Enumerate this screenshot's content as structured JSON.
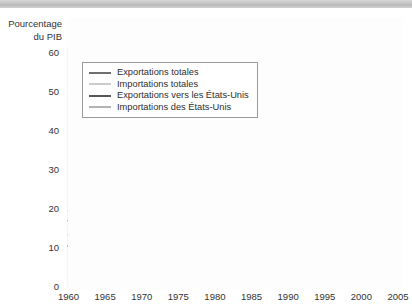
{
  "figure": {
    "axis_title_line1": "Pourcentage",
    "axis_title_line2": "du PIB"
  },
  "colors": {
    "exports_total": "#6f6f6f",
    "imports_total": "#cbcbcb",
    "exports_us": "#555555",
    "imports_us": "#b2b2b2",
    "axis": "#4a4a4a",
    "top_bar": "#c3c3c3"
  },
  "legend": {
    "items": [
      {
        "label": "Exportations totales",
        "series": "exports_total"
      },
      {
        "label": "Importations totales",
        "series": "imports_total"
      },
      {
        "label": "Exportations vers les États-Unis",
        "series": "exports_us"
      },
      {
        "label": "Importations des États-Unis",
        "series": "imports_us"
      }
    ]
  },
  "chart_data": {
    "type": "line",
    "title": "",
    "xlabel": "",
    "ylabel": "Pourcentage du PIB",
    "xlim": [
      1960,
      2005
    ],
    "ylim": [
      0,
      60
    ],
    "ytick_labels": [
      "0",
      "10",
      "20",
      "30",
      "40",
      "50",
      "60"
    ],
    "yticks": [
      0,
      10,
      20,
      30,
      40,
      50,
      60
    ],
    "xtick_labels": [
      "1960",
      "1965",
      "1970",
      "1975",
      "1980",
      "1985",
      "1990",
      "1995",
      "2000",
      "2005"
    ],
    "xticks": [
      1960,
      1965,
      1970,
      1975,
      1980,
      1985,
      1990,
      1995,
      2000,
      2005
    ],
    "minor_xticks_every": 1,
    "grid": false,
    "legend_position": "upper-left-inside",
    "x": [
      1960,
      1961,
      1962,
      1963,
      1964,
      1965,
      1966,
      1967,
      1968,
      1969,
      1970,
      1971,
      1972,
      1973,
      1974,
      1975,
      1976,
      1977,
      1978,
      1979,
      1980,
      1981,
      1982,
      1983,
      1984,
      1985,
      1986,
      1987,
      1988,
      1989,
      1990,
      1991,
      1992,
      1993,
      1994,
      1995,
      1996,
      1997,
      1998,
      1999,
      2000,
      2001,
      2002,
      2003,
      2004,
      2005
    ],
    "series": [
      {
        "name": "Exportations totales",
        "key": "exports_total",
        "color": "#6f6f6f",
        "values": [
          17.0,
          17.5,
          17.8,
          18.3,
          19.5,
          19.3,
          20.3,
          20.8,
          21.9,
          22.0,
          22.6,
          22.0,
          22.3,
          23.5,
          25.5,
          24.2,
          23.6,
          25.2,
          26.6,
          28.3,
          28.7,
          27.3,
          26.1,
          25.5,
          28.3,
          28.0,
          27.5,
          26.6,
          26.5,
          25.8,
          25.9,
          25.0,
          27.0,
          29.8,
          33.6,
          37.1,
          38.2,
          40.0,
          42.5,
          44.0,
          45.6,
          43.7,
          41.4,
          38.3,
          38.7,
          37.5
        ]
      },
      {
        "name": "Importations totales",
        "key": "imports_total",
        "color": "#cbcbcb",
        "values": [
          19.5,
          19.2,
          19.4,
          19.5,
          20.3,
          21.3,
          23.0,
          23.1,
          24.2,
          24.6,
          23.3,
          23.5,
          24.3,
          25.4,
          28.4,
          26.1,
          25.5,
          26.8,
          28.1,
          29.9,
          29.3,
          28.4,
          26.1,
          26.0,
          28.9,
          29.5,
          29.5,
          28.3,
          28.6,
          27.8,
          27.1,
          27.0,
          28.6,
          31.0,
          34.1,
          36.0,
          36.1,
          39.3,
          41.2,
          42.2,
          43.2,
          40.6,
          39.2,
          37.0,
          38.0,
          38.6
        ]
      },
      {
        "name": "Exportations vers les États-Unis",
        "key": "exports_us",
        "color": "#555555",
        "values": [
          10.5,
          10.9,
          11.1,
          11.5,
          12.1,
          12.4,
          13.4,
          13.8,
          15.0,
          15.5,
          15.6,
          15.4,
          15.9,
          16.6,
          17.2,
          15.5,
          16.6,
          17.9,
          19.3,
          19.5,
          18.6,
          18.8,
          18.2,
          19.4,
          22.2,
          22.3,
          21.8,
          21.4,
          21.3,
          20.5,
          20.6,
          20.1,
          22.0,
          24.6,
          28.1,
          29.7,
          30.2,
          31.5,
          33.9,
          35.9,
          38.6,
          36.4,
          34.3,
          31.5,
          31.8,
          31.3
        ]
      },
      {
        "name": "Importations des États-Unis",
        "key": "imports_us",
        "color": "#b2b2b2",
        "values": [
          13.4,
          12.9,
          13.1,
          13.0,
          13.5,
          14.4,
          15.9,
          16.2,
          17.4,
          17.6,
          16.3,
          16.6,
          17.1,
          17.5,
          19.3,
          17.7,
          17.4,
          18.0,
          18.8,
          19.6,
          18.5,
          18.4,
          16.7,
          17.4,
          19.6,
          20.1,
          20.0,
          19.1,
          19.3,
          18.6,
          18.0,
          17.6,
          18.8,
          20.4,
          22.3,
          23.0,
          23.2,
          25.3,
          26.4,
          27.7,
          28.8,
          27.2,
          26.4,
          25.0,
          25.8,
          26.0
        ]
      }
    ]
  }
}
